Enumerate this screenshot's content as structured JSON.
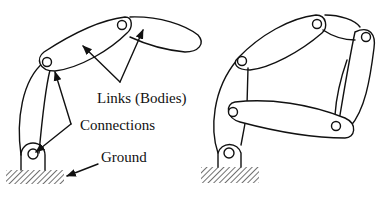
{
  "diagram": {
    "type": "kinematic linkage (robot arm) schematic",
    "left_figure": {
      "description": "Open-chain serial linkage with labels",
      "labels": {
        "links": "Links (Bodies)",
        "connections": "Connections",
        "ground": "Ground"
      },
      "joints": 3,
      "links": 3
    },
    "right_figure": {
      "description": "Closed-loop linkage without labels",
      "joints": 6,
      "links": 4
    },
    "colors": {
      "stroke": "#111111",
      "background": "#ffffff"
    }
  }
}
